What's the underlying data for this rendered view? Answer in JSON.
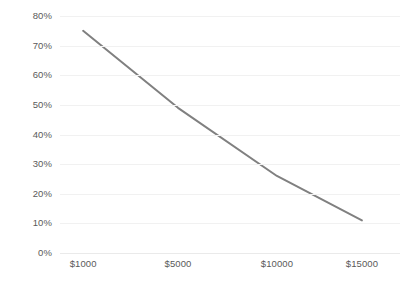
{
  "chart_data": {
    "type": "line",
    "title": "",
    "subtitle": "",
    "xlabel": "",
    "ylabel": "",
    "categories": [
      "$1000",
      "$5000",
      "$10000",
      "$15000"
    ],
    "series": [
      {
        "name": "",
        "values": [
          75,
          49,
          26,
          11
        ],
        "color": "#808080",
        "line_width": 2
      }
    ],
    "y_ticks": [
      "0%",
      "10%",
      "20%",
      "30%",
      "40%",
      "50%",
      "60%",
      "70%",
      "80%"
    ],
    "y_tick_values": [
      0,
      10,
      20,
      30,
      40,
      50,
      60,
      70,
      80
    ],
    "ylim": [
      0,
      80
    ],
    "grid": true,
    "grid_axis": "y",
    "grid_color": "#f1f1f1",
    "legend": "none",
    "background_color": "#ffffff",
    "tick_label_color": "#5a5a5a"
  }
}
